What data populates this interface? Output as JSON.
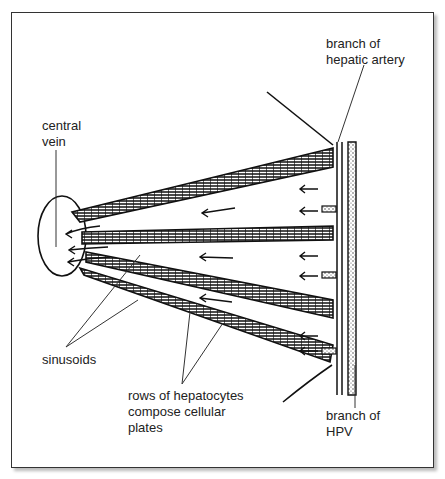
{
  "diagram": {
    "type": "liver lobule hepatic plates schematic",
    "labels": {
      "hepatic_artery": "branch of\nhepatic artery",
      "central_vein": "central\nvein",
      "sinusoids": "sinusoids",
      "hepatocytes": "rows of hepatocytes\ncompose cellular\nplates",
      "hpv": "branch of\nHPV"
    },
    "colors": {
      "line": "#111111",
      "label_text": "#222222",
      "leader": "#333333",
      "frame": "#333333"
    }
  }
}
